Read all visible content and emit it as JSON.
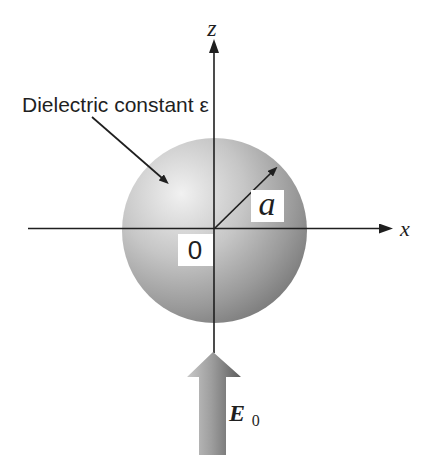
{
  "figure": {
    "labels": {
      "z_axis": "z",
      "x_axis": "x",
      "dielectric": "Dielectric constant ε",
      "radius": "a",
      "origin": "0",
      "field_symbol": "E",
      "field_subscript": "0"
    },
    "colors": {
      "background": "#ffffff",
      "axis": "#1f1f1f",
      "text": "#1f1f1f",
      "label_box": "#ffffff",
      "sphere_highlight": "#f1f1f1",
      "sphere_light": "#c6c6c6",
      "sphere_mid": "#9a9a9a",
      "sphere_edge": "#747474",
      "field_arrow_light": "#c8c8c8",
      "field_arrow_mid": "#9e9e9e",
      "field_arrow_dark": "#5c5c5c"
    }
  }
}
